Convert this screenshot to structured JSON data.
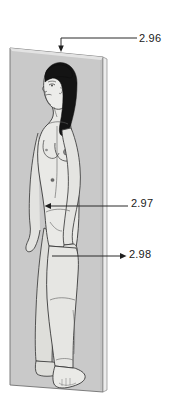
{
  "figure": {
    "type": "anatomical-line-drawing",
    "background_color": "#ffffff",
    "panel_color": "#c9c9c9",
    "panel_edge_color": "#6e6e6e",
    "skin_color": "#e9e9e6",
    "hair_color": "#141414",
    "outline_color": "#3a3a3a",
    "leader_color": "#2b2b2b"
  },
  "reference_labels": [
    {
      "id": "label-296",
      "text": "2.96",
      "points_to": "top edge of panel",
      "arrow_direction": "down",
      "leader_shape": "horizontal-then-down"
    },
    {
      "id": "label-297",
      "text": "2.97",
      "points_to": "hip and pelvis region of figure",
      "arrow_direction": "left",
      "leader_shape": "horizontal"
    },
    {
      "id": "label-298",
      "text": "2.98",
      "points_to": "thigh and hand region of figure",
      "arrow_direction": "right",
      "leader_shape": "horizontal"
    }
  ]
}
